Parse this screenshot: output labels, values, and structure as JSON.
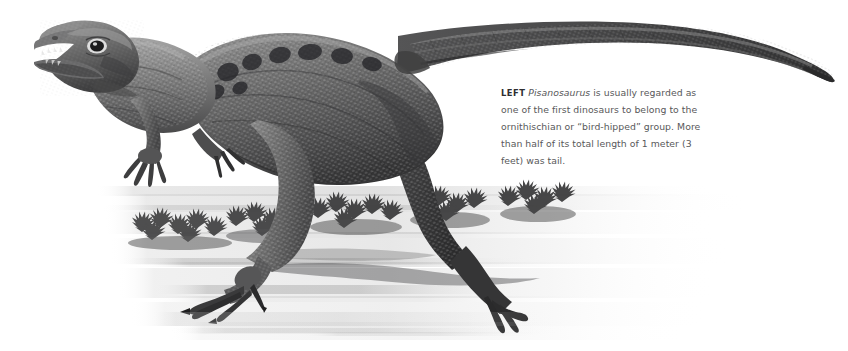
{
  "figure": {
    "subject": "Pisanosaurus",
    "illustration_alt": "Grayscale airbrush illustration of a small bipedal dinosaur, Pisanosaurus, striding to the left with a long tapering tail, over a washy ground with low shrubs",
    "background_color": "#ffffff",
    "ink_color": "#3a3a3c"
  },
  "caption": {
    "lead_label": "LEFT",
    "genus": "Pisanosaurus",
    "text_after_genus": " is usually regarded as one of the first dinosaurs to belong to the ornithischian or “bird-hipped” group. More than half of its total length of 1 meter (3 feet) was tail.",
    "text_color": "#58585a",
    "lead_color": "#2e2e30"
  }
}
